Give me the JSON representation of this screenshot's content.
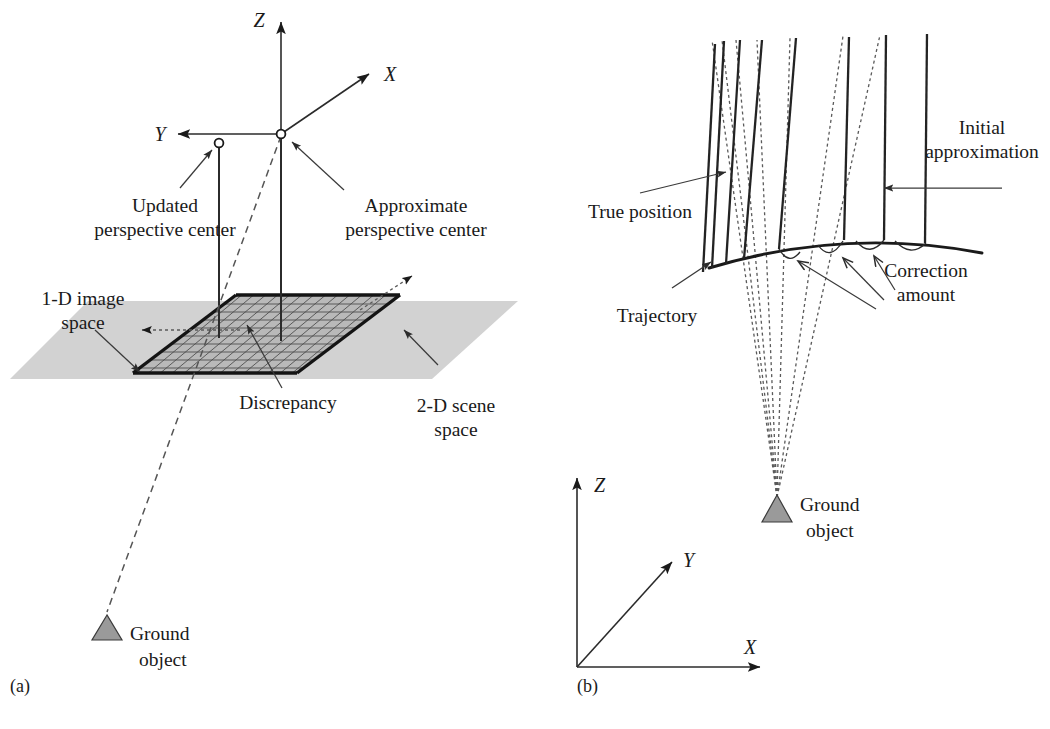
{
  "figure": {
    "panels": [
      {
        "id": "a",
        "caption": "(a)",
        "axes": [
          {
            "name": "Z",
            "label": "Z"
          },
          {
            "name": "X",
            "label": "X"
          },
          {
            "name": "Y",
            "label": "Y"
          }
        ],
        "labels": {
          "updated_perspective_center_l1": "Updated",
          "updated_perspective_center_l2": "perspective center",
          "approximate_perspective_center_l1": "Approximate",
          "approximate_perspective_center_l2": "perspective center",
          "one_d_image_space_l1": "1-D image",
          "one_d_image_space_l2": "space",
          "discrepancy": "Discrepancy",
          "two_d_scene_space_l1": "2-D scene",
          "two_d_scene_space_l2": "space",
          "ground_object_l1": "Ground",
          "ground_object_l2": "object"
        }
      },
      {
        "id": "b",
        "caption": "(b)",
        "axes": [
          {
            "name": "Z",
            "label": "Z"
          },
          {
            "name": "Y",
            "label": "Y"
          },
          {
            "name": "X",
            "label": "X"
          }
        ],
        "labels": {
          "initial_approximation_l1": "Initial",
          "initial_approximation_l2": "approximation",
          "true_position": "True position",
          "trajectory": "Trajectory",
          "correction_amount_l1": "Correction",
          "correction_amount_l2": "amount",
          "ground_object_l1": "Ground",
          "ground_object_l2": "object"
        }
      }
    ],
    "colors": {
      "background": "#ffffff",
      "ink": "#1a1a1a",
      "plane_gray": "#d2d2d2",
      "strip_gray": "#b9b9b9",
      "ground_object_gray": "#9a9a9a",
      "dashed_gray": "#555555"
    }
  }
}
